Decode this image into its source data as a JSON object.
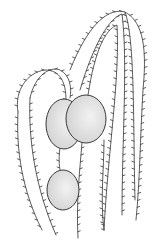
{
  "image": {
    "subject": "botanical line drawing of drooping branches with small leaf ticks and three oval capsules",
    "colors": {
      "ink": "#4a4a4a",
      "capsule_fill": "#e4e4e4",
      "background": "#ffffff"
    }
  }
}
